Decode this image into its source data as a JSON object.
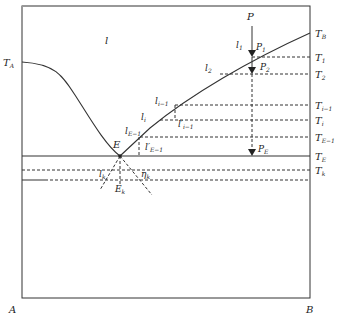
{
  "diagram": {
    "type": "binary eutectic phase diagram",
    "region_label": "l",
    "axis_labels": {
      "left_bottom": "A",
      "right_bottom": "B"
    },
    "left_temp": "T_A",
    "right_temp_labels": [
      "T_B",
      "T_1",
      "T_2",
      "T_{i-1}",
      "T_i",
      "T_{E-1}",
      "T_E",
      "T_k"
    ],
    "point_labels": {
      "P": "P",
      "P1": "P_1",
      "P2": "P_2",
      "PE": "P_E",
      "E": "E",
      "Ek": "E_k"
    },
    "liquidus_labels": {
      "l1": "l_1",
      "l2": "l_2",
      "li_minus": "l_{i-1}",
      "li": "l_i",
      "lE": "l_{E-1}",
      "lprime_i": "l'_{i-1}",
      "lprime_E": "l'_{E-1}",
      "lk": "l_k",
      "eta": "η_k"
    },
    "colors": {
      "line": "#333333",
      "background": "#ffffff"
    }
  },
  "caption": ""
}
